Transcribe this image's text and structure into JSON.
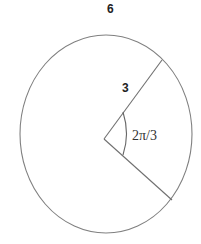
{
  "diagram": {
    "title_label": "6",
    "radius_label": "3",
    "angle_label": "2π/3",
    "stroke_color": "#777777",
    "text_color": "#222222"
  }
}
